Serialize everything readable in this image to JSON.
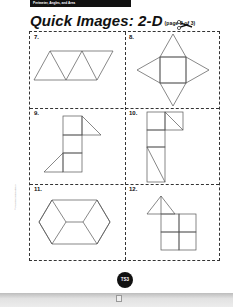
{
  "header": {
    "section_label": "Perimeter, Angles, and Area"
  },
  "title": {
    "main": "Quick Images: 2-D",
    "subtitle": "(page 2 of 3)"
  },
  "icons": {
    "cut_line": "scissors-icon"
  },
  "cells": [
    {
      "number": "7.",
      "figure": "three triangles forming a parallelogram strip"
    },
    {
      "number": "8.",
      "figure": "square with a triangle on each side (star net)"
    },
    {
      "number": "9.",
      "figure": "stack of three squares with two triangles"
    },
    {
      "number": "10.",
      "figure": "column of squares split by diagonals"
    },
    {
      "number": "11.",
      "figure": "hexagon divided into rhombuses"
    },
    {
      "number": "12.",
      "figure": "four squares with a triangle on top"
    }
  ],
  "side_note": "© Pearson Education 3",
  "footer": {
    "page_number": "TS3"
  },
  "colors": {
    "ink": "#111111",
    "line": "#555555",
    "paper": "#ffffff"
  }
}
